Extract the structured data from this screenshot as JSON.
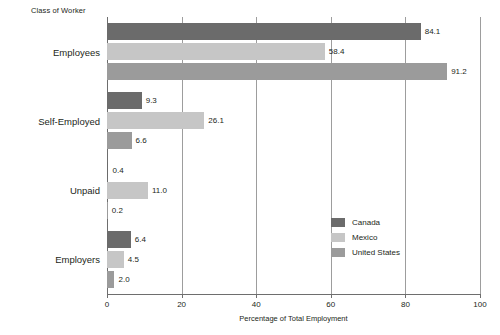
{
  "chart_data": {
    "type": "bar",
    "orientation": "horizontal",
    "title": "",
    "group_axis_title": "Class of Worker",
    "xlabel": "Percentage of Total Employment",
    "ylabel": "Class of Worker",
    "xlim": [
      0,
      100
    ],
    "xticks": [
      0,
      20,
      40,
      60,
      80,
      100
    ],
    "xtick_labels": [
      "0",
      "20",
      "40",
      "60",
      "80",
      "100"
    ],
    "grid": true,
    "grid_axis": "x",
    "legend_position": "inside-center-right",
    "categories": [
      "Employees",
      "Self-Employed",
      "Unpaid",
      "Employers"
    ],
    "series": [
      {
        "name": "Canada",
        "color": "#6b6b6b",
        "values": [
          84.1,
          9.3,
          0.4,
          6.4
        ],
        "labels": [
          "84.1",
          "9.3",
          "0.4",
          "6.4"
        ]
      },
      {
        "name": "Mexico",
        "color": "#c6c6c6",
        "values": [
          58.4,
          26.1,
          11.0,
          4.5
        ],
        "labels": [
          "58.4",
          "26.1",
          "11.0",
          "4.5"
        ]
      },
      {
        "name": "United States",
        "color": "#9b9b9b",
        "values": [
          91.2,
          6.6,
          0.2,
          2.0
        ],
        "labels": [
          "91.2",
          "6.6",
          "0.2",
          "2.0"
        ]
      }
    ],
    "colors": {
      "canada": "#6b6b6b",
      "mexico": "#c6c6c6",
      "united_states": "#9b9b9b",
      "gridline": "#9d9d9d",
      "axis": "#6e6e6e",
      "text": "#231f20",
      "background": "#ffffff"
    }
  }
}
